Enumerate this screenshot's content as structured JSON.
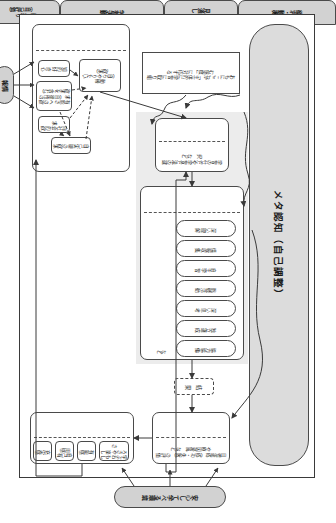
{
  "diagram": {
    "title_band": "メタ認知（自己調整）",
    "environment_label": "安心して学べる環境",
    "information_label": "情 報",
    "note_box": "おもにここが「主体的に学習に取り組む態度」に対応する",
    "result_box": "結 果",
    "etc_mark": "など",
    "sections": {
      "needs": {
        "header": "欲求・動機",
        "motive": "動機\n（自らやりたい欲求）",
        "items": [
          "知的好奇心",
          "有能さへの欲求（自律性の欲求を含む）",
          "向社会的欲求",
          "自己実現の欲求"
        ]
      },
      "outlook": {
        "header": "見通し",
        "body": "学習の仕方や学習方法の選択 など"
      },
      "activities": {
        "header": "学習活動",
        "items": [
          "深い理解",
          "情報収集",
          "自主学習",
          "挑戦活動",
          "深い思考",
          "独立達成",
          "協力協働"
        ]
      },
      "reflection": {
        "header": "振り返り\n（自己評価）",
        "body": "目標達成（成功・失敗）の評価や原因帰属 など"
      },
      "cognition": {
        "header": "認知・感情",
        "items": [
          "学ぶおもしろさや楽しさ",
          "有能感",
          "自己有用感",
          "充実感"
        ]
      }
    }
  },
  "colors": {
    "header_fill": "#d2d2d2",
    "band_fill": "#dcdcdc",
    "shade_fill": "#ececec",
    "stroke": "#4a4a4a",
    "page_bg": "#ffffff"
  }
}
